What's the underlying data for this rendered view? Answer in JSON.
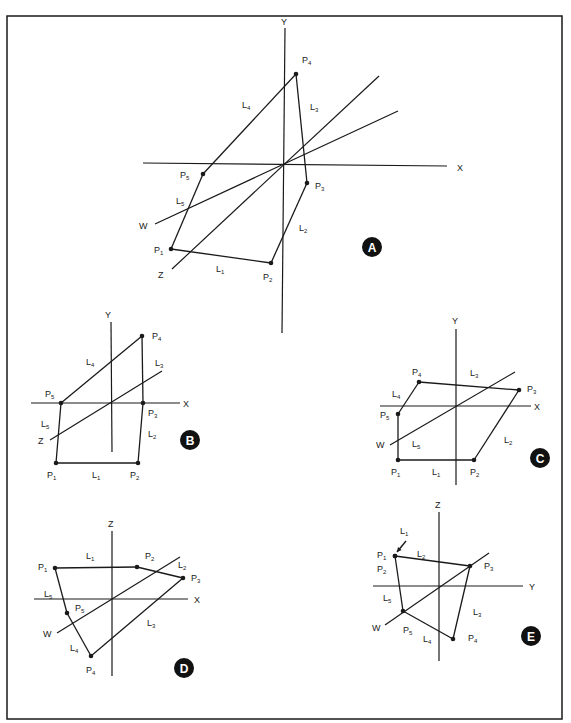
{
  "frame": {
    "x": 7,
    "y": 16,
    "width": 555,
    "height": 703,
    "stroke": "#1a1a1a"
  },
  "colors": {
    "ink": "#1a1a1a",
    "badge_fill": "#111111",
    "badge_text": "#ffffff",
    "background": "#ffffff"
  },
  "panels": [
    {
      "id": "A",
      "badge": {
        "label": "A",
        "cx": 372,
        "cy": 247,
        "r": 10
      },
      "axes": [
        {
          "name": "Y",
          "x1": 285,
          "y1": 28,
          "x2": 282,
          "y2": 333,
          "label": {
            "text": "Y",
            "x": 281,
            "y": 25
          }
        },
        {
          "name": "X",
          "x1": 143,
          "y1": 163,
          "x2": 447,
          "y2": 166,
          "label": {
            "text": "X",
            "x": 457,
            "y": 171
          }
        },
        {
          "name": "Z",
          "x1": 172,
          "y1": 269,
          "x2": 379,
          "y2": 76,
          "label": {
            "text": "Z",
            "x": 158,
            "y": 278
          }
        },
        {
          "name": "W",
          "x1": 155,
          "y1": 224,
          "x2": 398,
          "y2": 111,
          "label": {
            "text": "W",
            "x": 139,
            "y": 229
          }
        }
      ],
      "points": [
        {
          "name": "P",
          "sub": "1",
          "x": 171,
          "y": 249,
          "lx": 154,
          "ly": 253
        },
        {
          "name": "P",
          "sub": "2",
          "x": 271,
          "y": 263,
          "lx": 263,
          "ly": 280
        },
        {
          "name": "P",
          "sub": "3",
          "x": 307,
          "y": 183,
          "lx": 315,
          "ly": 189
        },
        {
          "name": "P",
          "sub": "4",
          "x": 296,
          "y": 74,
          "lx": 302,
          "ly": 63
        },
        {
          "name": "P",
          "sub": "5",
          "x": 203,
          "y": 174,
          "lx": 180,
          "ly": 178
        }
      ],
      "edges": [
        {
          "name": "L",
          "sub": "1",
          "from": 0,
          "to": 1,
          "lx": 216,
          "ly": 272
        },
        {
          "name": "L",
          "sub": "2",
          "from": 1,
          "to": 2,
          "lx": 299,
          "ly": 231
        },
        {
          "name": "L",
          "sub": "3",
          "from": 2,
          "to": 3,
          "lx": 310,
          "ly": 110
        },
        {
          "name": "L",
          "sub": "4",
          "from": 3,
          "to": 4,
          "lx": 242,
          "ly": 108
        },
        {
          "name": "L",
          "sub": "5",
          "from": 4,
          "to": 0,
          "lx": 176,
          "ly": 204
        }
      ]
    },
    {
      "id": "B",
      "badge": {
        "label": "B",
        "cx": 190,
        "cy": 440,
        "r": 10
      },
      "axes": [
        {
          "name": "Y",
          "x1": 111,
          "y1": 322,
          "x2": 112,
          "y2": 452,
          "label": {
            "text": "Y",
            "x": 105,
            "y": 318
          }
        },
        {
          "name": "X",
          "x1": 31,
          "y1": 403,
          "x2": 180,
          "y2": 403,
          "label": {
            "text": "X",
            "x": 183,
            "y": 407
          }
        },
        {
          "name": "Z",
          "x1": 50,
          "y1": 440,
          "x2": 162,
          "y2": 371,
          "label": {
            "text": "Z",
            "x": 38,
            "y": 444
          }
        }
      ],
      "points": [
        {
          "name": "P",
          "sub": "1",
          "x": 56,
          "y": 463,
          "lx": 47,
          "ly": 478
        },
        {
          "name": "P",
          "sub": "2",
          "x": 138,
          "y": 463,
          "lx": 130,
          "ly": 478
        },
        {
          "name": "P",
          "sub": "3",
          "x": 143,
          "y": 403,
          "lx": 148,
          "ly": 416
        },
        {
          "name": "P",
          "sub": "4",
          "x": 142,
          "y": 336,
          "lx": 152,
          "ly": 339
        },
        {
          "name": "P",
          "sub": "5",
          "x": 61,
          "y": 403,
          "lx": 45,
          "ly": 397
        }
      ],
      "edges": [
        {
          "name": "L",
          "sub": "1",
          "from": 0,
          "to": 1,
          "lx": 92,
          "ly": 478
        },
        {
          "name": "L",
          "sub": "2",
          "from": 1,
          "to": 2,
          "lx": 148,
          "ly": 437
        },
        {
          "name": "L",
          "sub": "3",
          "from": 2,
          "to": 3,
          "lx": 155,
          "ly": 366
        },
        {
          "name": "L",
          "sub": "4",
          "from": 3,
          "to": 4,
          "lx": 86,
          "ly": 365
        },
        {
          "name": "L",
          "sub": "5",
          "from": 4,
          "to": 0,
          "lx": 41,
          "ly": 427
        }
      ]
    },
    {
      "id": "C",
      "badge": {
        "label": "C",
        "cx": 540,
        "cy": 458,
        "r": 10
      },
      "axes": [
        {
          "name": "Y",
          "x1": 456,
          "y1": 329,
          "x2": 456,
          "y2": 485,
          "label": {
            "text": "Y",
            "x": 452,
            "y": 324
          }
        },
        {
          "name": "X",
          "x1": 380,
          "y1": 406,
          "x2": 531,
          "y2": 406,
          "label": {
            "text": "X",
            "x": 534,
            "y": 410
          }
        },
        {
          "name": "W",
          "x1": 390,
          "y1": 445,
          "x2": 515,
          "y2": 372,
          "label": {
            "text": "W",
            "x": 376,
            "y": 448
          }
        }
      ],
      "points": [
        {
          "name": "P",
          "sub": "1",
          "x": 398,
          "y": 460,
          "lx": 391,
          "ly": 475
        },
        {
          "name": "P",
          "sub": "2",
          "x": 474,
          "y": 460,
          "lx": 470,
          "ly": 475
        },
        {
          "name": "P",
          "sub": "3",
          "x": 519,
          "y": 390,
          "lx": 527,
          "ly": 392
        },
        {
          "name": "P",
          "sub": "4",
          "x": 419,
          "y": 382,
          "lx": 412,
          "ly": 375
        },
        {
          "name": "P",
          "sub": "5",
          "x": 398,
          "y": 414,
          "lx": 380,
          "ly": 418
        }
      ],
      "edges": [
        {
          "name": "L",
          "sub": "1",
          "from": 0,
          "to": 1,
          "lx": 432,
          "ly": 475
        },
        {
          "name": "L",
          "sub": "2",
          "from": 1,
          "to": 2,
          "lx": 504,
          "ly": 443
        },
        {
          "name": "L",
          "sub": "3",
          "from": 2,
          "to": 3,
          "lx": 470,
          "ly": 376
        },
        {
          "name": "L",
          "sub": "4",
          "from": 3,
          "to": 4,
          "lx": 392,
          "ly": 397
        },
        {
          "name": "L",
          "sub": "5",
          "from": 4,
          "to": 0,
          "lx": 412,
          "ly": 447
        }
      ]
    },
    {
      "id": "D",
      "badge": {
        "label": "D",
        "cx": 184,
        "cy": 668,
        "r": 10
      },
      "axes": [
        {
          "name": "Z",
          "x1": 112,
          "y1": 531,
          "x2": 112,
          "y2": 676,
          "label": {
            "text": "Z",
            "x": 108,
            "y": 527
          }
        },
        {
          "name": "X",
          "x1": 34,
          "y1": 599,
          "x2": 188,
          "y2": 599,
          "label": {
            "text": "X",
            "x": 194,
            "y": 603
          }
        },
        {
          "name": "W",
          "x1": 57,
          "y1": 633,
          "x2": 180,
          "y2": 557,
          "label": {
            "text": "W",
            "x": 43,
            "y": 637
          }
        }
      ],
      "points": [
        {
          "name": "P",
          "sub": "1",
          "x": 55,
          "y": 568,
          "lx": 38,
          "ly": 570
        },
        {
          "name": "P",
          "sub": "2",
          "x": 137,
          "y": 567,
          "lx": 145,
          "ly": 559
        },
        {
          "name": "P",
          "sub": "3",
          "x": 183,
          "y": 578,
          "lx": 191,
          "ly": 581
        },
        {
          "name": "P",
          "sub": "4",
          "x": 91,
          "y": 656,
          "lx": 86,
          "ly": 673
        },
        {
          "name": "P",
          "sub": "5",
          "x": 67,
          "y": 613,
          "lx": 75,
          "ly": 611
        }
      ],
      "edges": [
        {
          "name": "L",
          "sub": "1",
          "from": 0,
          "to": 1,
          "lx": 86,
          "ly": 559
        },
        {
          "name": "L",
          "sub": "2",
          "from": 1,
          "to": 2,
          "lx": 178,
          "ly": 568
        },
        {
          "name": "L",
          "sub": "3",
          "from": 2,
          "to": 3,
          "lx": 147,
          "ly": 626
        },
        {
          "name": "L",
          "sub": "4",
          "from": 3,
          "to": 4,
          "lx": 70,
          "ly": 651
        },
        {
          "name": "L",
          "sub": "5",
          "from": 4,
          "to": 0,
          "lx": 44,
          "ly": 597
        }
      ]
    },
    {
      "id": "E",
      "badge": {
        "label": "E",
        "cx": 531,
        "cy": 636,
        "r": 10
      },
      "axes": [
        {
          "name": "Z",
          "x1": 439,
          "y1": 512,
          "x2": 439,
          "y2": 661,
          "label": {
            "text": "Z",
            "x": 435,
            "y": 508
          }
        },
        {
          "name": "Y",
          "x1": 373,
          "y1": 586,
          "x2": 523,
          "y2": 586,
          "label": {
            "text": "Y",
            "x": 529,
            "y": 590
          }
        },
        {
          "name": "W",
          "x1": 385,
          "y1": 625,
          "x2": 489,
          "y2": 553,
          "label": {
            "text": "W",
            "x": 372,
            "y": 631
          }
        }
      ],
      "points": [
        {
          "name": "P",
          "sub": "1",
          "x": 395,
          "y": 556,
          "lx": 377,
          "ly": 558
        },
        {
          "name": "P",
          "sub": "2",
          "x": 395,
          "y": 556,
          "lx": 377,
          "ly": 572
        },
        {
          "name": "P",
          "sub": "3",
          "x": 470,
          "y": 566,
          "lx": 484,
          "ly": 569
        },
        {
          "name": "P",
          "sub": "4",
          "x": 453,
          "y": 639,
          "lx": 468,
          "ly": 641
        },
        {
          "name": "P",
          "sub": "5",
          "x": 403,
          "y": 611,
          "lx": 403,
          "ly": 633
        }
      ],
      "edges": [
        {
          "name": "L",
          "sub": "1",
          "from": 0,
          "to": 1,
          "lx": 400,
          "ly": 534,
          "arrow": {
            "x1": 406,
            "y1": 541,
            "x2": 397,
            "y2": 552
          }
        },
        {
          "name": "L",
          "sub": "2",
          "from": 1,
          "to": 2,
          "lx": 417,
          "ly": 557
        },
        {
          "name": "L",
          "sub": "3",
          "from": 2,
          "to": 3,
          "lx": 473,
          "ly": 615
        },
        {
          "name": "L",
          "sub": "4",
          "from": 3,
          "to": 4,
          "lx": 423,
          "ly": 642
        },
        {
          "name": "L",
          "sub": "5",
          "from": 4,
          "to": 0,
          "lx": 383,
          "ly": 601
        }
      ],
      "polygon_order": [
        0,
        2,
        3,
        4
      ]
    }
  ]
}
